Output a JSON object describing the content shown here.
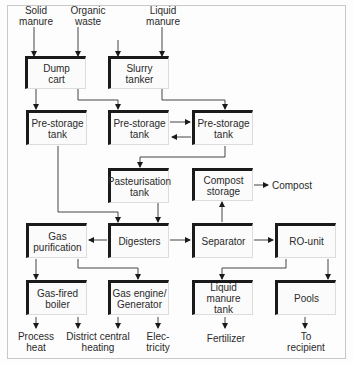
{
  "inputs": {
    "solid_manure": "Solid\nmanure",
    "organic_waste": "Organic\nwaste",
    "liquid_manure": "Liquid\nmanure"
  },
  "nodes": {
    "dump_cart": "Dump\ncart",
    "slurry_tanker": "Slurry\ntanker",
    "pre_storage_1": "Pre-storage\ntank",
    "pre_storage_2": "Pre-storage\ntank",
    "pre_storage_3": "Pre-storage\ntank",
    "pasteurisation": "Pasteurisation\ntank",
    "compost_storage": "Compost\nstorage",
    "digesters": "Digesters",
    "gas_purification": "Gas\npurification",
    "separator": "Separator",
    "ro_unit": "RO-unit",
    "gas_boiler": "Gas-fired\nboiler",
    "gas_engine": "Gas engine/\nGenerator",
    "liquid_manure_tank": "Liquid manure\ntank",
    "pools": "Pools"
  },
  "outputs": {
    "compost": "Compost",
    "process_heat": "Process\nheat",
    "district_heating": "District central\nheating",
    "electricity": "Elec-\ntricity",
    "fertilizer": "Fertilizer",
    "to_recipient": "To\nrecipient"
  },
  "edges": [
    [
      "solid_manure",
      "dump_cart"
    ],
    [
      "organic_waste",
      "dump_cart"
    ],
    [
      "organic_waste",
      "slurry_tanker"
    ],
    [
      "liquid_manure",
      "slurry_tanker"
    ],
    [
      "dump_cart",
      "pre_storage_1"
    ],
    [
      "dump_cart",
      "pre_storage_2"
    ],
    [
      "slurry_tanker",
      "pre_storage_3"
    ],
    [
      "pre_storage_2",
      "pre_storage_3"
    ],
    [
      "pre_storage_3",
      "pre_storage_2"
    ],
    [
      "pre_storage_3",
      "pasteurisation"
    ],
    [
      "pre_storage_1",
      "digesters"
    ],
    [
      "pasteurisation",
      "digesters"
    ],
    [
      "digesters",
      "gas_purification"
    ],
    [
      "digesters",
      "separator"
    ],
    [
      "separator",
      "compost_storage"
    ],
    [
      "compost_storage",
      "compost"
    ],
    [
      "separator",
      "ro_unit"
    ],
    [
      "gas_purification",
      "gas_boiler"
    ],
    [
      "gas_purification",
      "gas_engine"
    ],
    [
      "gas_boiler",
      "process_heat"
    ],
    [
      "gas_boiler",
      "district_heating"
    ],
    [
      "gas_engine",
      "district_heating"
    ],
    [
      "gas_engine",
      "electricity"
    ],
    [
      "ro_unit",
      "liquid_manure_tank"
    ],
    [
      "ro_unit",
      "pools"
    ],
    [
      "liquid_manure_tank",
      "fertilizer"
    ],
    [
      "pools",
      "to_recipient"
    ]
  ]
}
